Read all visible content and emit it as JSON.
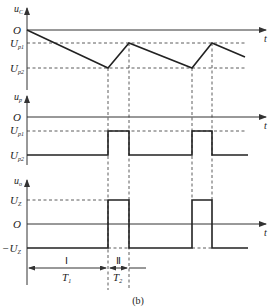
{
  "figure": {
    "caption": "(b)",
    "panels": [
      {
        "id": "uc",
        "y_label": "u",
        "y_label_sub": "C",
        "x_label": "t",
        "levels": [
          {
            "label": "O",
            "sub": ""
          },
          {
            "label": "U",
            "sub": "p1"
          },
          {
            "label": "U",
            "sub": "p2"
          }
        ]
      },
      {
        "id": "up",
        "y_label": "u",
        "y_label_sub": "p",
        "x_label": "t",
        "levels": [
          {
            "label": "O",
            "sub": ""
          },
          {
            "label": "U",
            "sub": "p1"
          },
          {
            "label": "U",
            "sub": "p2"
          }
        ]
      },
      {
        "id": "uo",
        "y_label": "u",
        "y_label_sub": "o",
        "x_label": "t",
        "levels": [
          {
            "label": "U",
            "sub": "Z"
          },
          {
            "label": "O",
            "sub": ""
          },
          {
            "label": "−U",
            "sub": "Z"
          }
        ]
      }
    ],
    "intervals": [
      {
        "roman": "Ⅰ",
        "label": "T",
        "sub": "1"
      },
      {
        "roman": "Ⅱ",
        "label": "T",
        "sub": "2"
      }
    ]
  }
}
